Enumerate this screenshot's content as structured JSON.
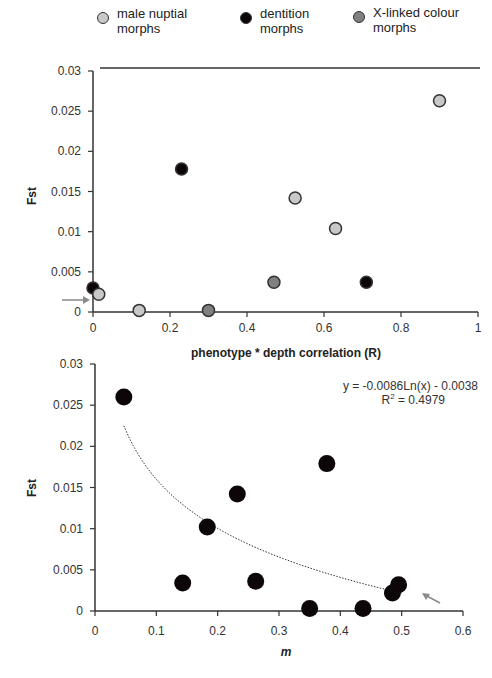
{
  "legend": {
    "items": [
      {
        "label_line1": "male nuptial",
        "label_line2": "morphs",
        "color": "#c8c8c8"
      },
      {
        "label_line1": "dentition",
        "label_line2": "morphs",
        "color": "#0d0608"
      },
      {
        "label_line1": "X-linked colour",
        "label_line2": "morphs",
        "color": "#808080"
      }
    ]
  },
  "chart_data": [
    {
      "type": "scatter",
      "title": "",
      "xlabel": "phenotype * depth correlation (R)",
      "ylabel": "Fst",
      "xlim": [
        0,
        1
      ],
      "ylim": [
        0,
        0.03
      ],
      "x_ticks": [
        "0",
        "0.2",
        "0.4",
        "0.6",
        "0.8",
        "1"
      ],
      "y_ticks": [
        "0",
        "0.005",
        "0.01",
        "0.015",
        "0.02",
        "0.025",
        "0.03"
      ],
      "grid": false,
      "legend_position": "top",
      "annotations": [
        "grey arrow pointing to points near origin"
      ],
      "series": [
        {
          "name": "male nuptial morphs",
          "color": "#c8c8c8",
          "x": [
            0.015,
            0.12,
            0.525,
            0.63,
            0.9
          ],
          "y": [
            0.0022,
            0.0002,
            0.0142,
            0.0104,
            0.0263
          ]
        },
        {
          "name": "dentition morphs",
          "color": "#0d0608",
          "x": [
            0.0,
            0.23,
            0.71
          ],
          "y": [
            0.003,
            0.0178,
            0.0037
          ]
        },
        {
          "name": "X-linked colour morphs",
          "color": "#808080",
          "x": [
            0.3,
            0.47
          ],
          "y": [
            0.0002,
            0.0037
          ]
        }
      ]
    },
    {
      "type": "scatter",
      "title": "",
      "xlabel": "m",
      "ylabel": "Fst",
      "xlim": [
        0,
        0.6
      ],
      "ylim": [
        0,
        0.03
      ],
      "x_ticks": [
        "0",
        "0.1",
        "0.2",
        "0.3",
        "0.4",
        "0.5",
        "0.6"
      ],
      "y_ticks": [
        "0",
        "0.005",
        "0.01",
        "0.015",
        "0.02",
        "0.025",
        "0.03"
      ],
      "grid": false,
      "trendline": {
        "type": "logarithmic",
        "equation": "y = -0.0086Ln(x) - 0.0038",
        "r2_label": "R",
        "r2_sup": "2",
        "r2_value": " = 0.4979",
        "x_range": [
          0.047,
          0.5
        ]
      },
      "annotations": [
        "grey arrow pointing to points near m=0.49"
      ],
      "series": [
        {
          "name": "Fst vs m",
          "color": "#0d0608",
          "x": [
            0.047,
            0.143,
            0.183,
            0.232,
            0.262,
            0.35,
            0.378,
            0.437,
            0.485,
            0.495
          ],
          "y": [
            0.026,
            0.0034,
            0.0102,
            0.0142,
            0.0036,
            0.0003,
            0.0179,
            0.0003,
            0.0022,
            0.0032
          ]
        }
      ]
    }
  ]
}
